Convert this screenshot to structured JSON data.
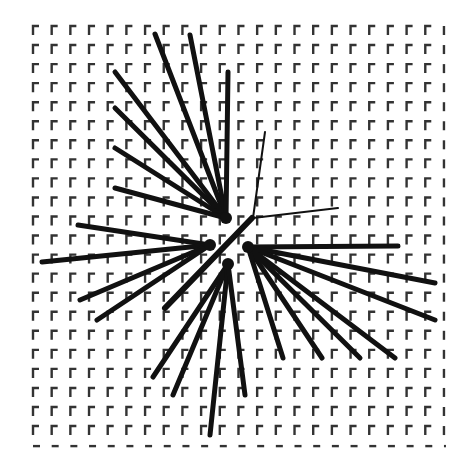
{
  "figure": {
    "width": 473,
    "height": 459,
    "background": "#ffffff",
    "ink": "#111111"
  },
  "grid": {
    "origin_x": 33,
    "origin_y": 26,
    "cols": 23,
    "rows": 23,
    "step_x": 18.68,
    "step_y": 19.05,
    "marker": "corner-bracket",
    "vertical_len": 9,
    "horizontal_len": 6,
    "stroke": 2.4,
    "color": "#333333"
  },
  "clusters": [
    {
      "name": "upper-left-fan",
      "origin": [
        226,
        218
      ],
      "width": 5,
      "endpoints": [
        [
          155,
          34
        ],
        [
          190,
          35
        ],
        [
          228,
          72
        ],
        [
          115,
          72
        ],
        [
          115,
          108
        ],
        [
          115,
          148
        ],
        [
          115,
          188
        ]
      ]
    },
    {
      "name": "right-fan",
      "origin": [
        248,
        247
      ],
      "width": 5,
      "endpoints": [
        [
          398,
          246
        ],
        [
          435,
          283
        ],
        [
          435,
          320
        ],
        [
          395,
          358
        ],
        [
          360,
          358
        ],
        [
          322,
          358
        ],
        [
          283,
          358
        ]
      ]
    },
    {
      "name": "left-fan",
      "origin": [
        210,
        245
      ],
      "width": 5,
      "endpoints": [
        [
          78,
          225
        ],
        [
          42,
          262
        ],
        [
          80,
          300
        ],
        [
          97,
          320
        ]
      ]
    },
    {
      "name": "bottom-fan",
      "origin": [
        228,
        264
      ],
      "width": 5,
      "endpoints": [
        [
          153,
          377
        ],
        [
          173,
          395
        ],
        [
          210,
          435
        ],
        [
          245,
          395
        ]
      ]
    }
  ],
  "single_lines": [
    {
      "name": "diagonal-bar",
      "from": [
        252,
        218
      ],
      "to": [
        165,
        308
      ],
      "width": 6
    },
    {
      "name": "thin-line-up",
      "from": [
        253,
        218
      ],
      "to": [
        265,
        132
      ],
      "width": 2
    },
    {
      "name": "thin-line-right",
      "from": [
        253,
        218
      ],
      "to": [
        338,
        208
      ],
      "width": 2
    }
  ]
}
